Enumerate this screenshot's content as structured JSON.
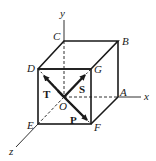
{
  "figure": {
    "axes": {
      "x": "x",
      "y": "y",
      "z": "z"
    },
    "vertices": {
      "origin": "O",
      "A": "A",
      "B": "B",
      "C": "C",
      "D": "D",
      "E": "E",
      "F": "F",
      "G": "G"
    },
    "vectors": {
      "P": "P",
      "S": "S",
      "T": "T"
    },
    "colors": {
      "line": "#1a1a1a",
      "background": "#ffffff"
    }
  }
}
